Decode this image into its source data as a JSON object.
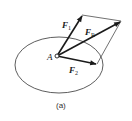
{
  "diagram": {
    "type": "force-parallelogram",
    "point": {
      "label": "A",
      "x": 57,
      "y": 56
    },
    "body_outline": {
      "shape": "ellipse",
      "cx": 59,
      "cy": 65,
      "rx": 44,
      "ry": 28
    },
    "vectors": [
      {
        "name": "F1",
        "label": "F",
        "subscript": "1",
        "from": [
          57,
          56
        ],
        "to": [
          82,
          16
        ]
      },
      {
        "name": "F2",
        "label": "F",
        "subscript": "2",
        "from": [
          57,
          56
        ],
        "to": [
          96,
          64
        ]
      },
      {
        "name": "FR",
        "label": "F",
        "subscript": "R",
        "from": [
          57,
          56
        ],
        "to": [
          120,
          22
        ]
      }
    ],
    "parallelogram": [
      [
        82,
        15
      ],
      [
        121,
        21
      ],
      [
        100,
        65
      ],
      [
        96,
        64
      ]
    ],
    "caption": "(a)",
    "colors": {
      "stroke": "#1a1a1a",
      "background": "#ffffff"
    }
  }
}
